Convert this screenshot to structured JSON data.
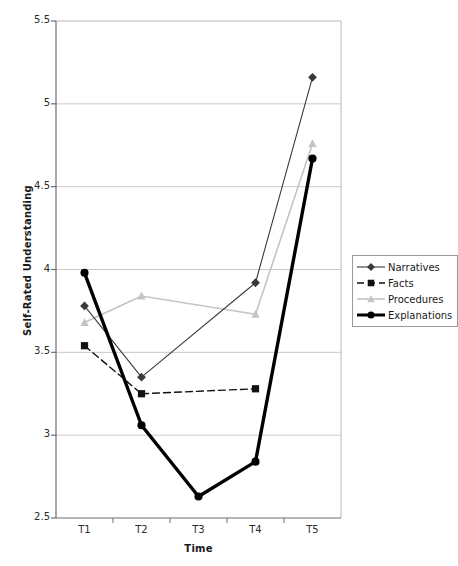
{
  "chart_data": {
    "type": "line",
    "title": "",
    "xlabel": "Time",
    "ylabel": "Self-Rated Understanding",
    "categories": [
      "T1",
      "T2",
      "T3",
      "T4",
      "T5"
    ],
    "ylim": [
      2.5,
      5.5
    ],
    "yticks": [
      "2.5",
      "3",
      "3.5",
      "4",
      "4.5",
      "5",
      "5.5"
    ],
    "ytick_values": [
      2.5,
      3,
      3.5,
      4,
      4.5,
      5,
      5.5
    ],
    "grid": "horizontal",
    "legend_position": "right",
    "series": [
      {
        "name": "Narratives",
        "marker": "diamond",
        "line": "solid-thin",
        "color": "#3a3a3a",
        "values": [
          3.78,
          3.35,
          null,
          3.92,
          5.16
        ]
      },
      {
        "name": "Facts",
        "marker": "square",
        "line": "dashed",
        "color": "#111111",
        "values": [
          3.54,
          3.25,
          null,
          3.28,
          null
        ]
      },
      {
        "name": "Procedures",
        "marker": "triangle",
        "line": "solid-light",
        "color": "#c4c4c4",
        "values": [
          3.68,
          3.84,
          null,
          3.73,
          4.76
        ]
      },
      {
        "name": "Explanations",
        "marker": "circle",
        "line": "solid-thick",
        "color": "#000000",
        "values": [
          3.98,
          3.06,
          2.63,
          2.84,
          4.67
        ]
      }
    ]
  }
}
